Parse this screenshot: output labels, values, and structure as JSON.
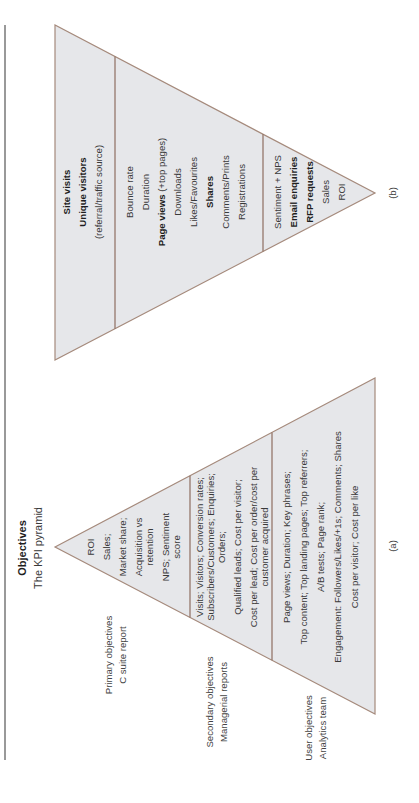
{
  "header": {
    "heading": "Objectives",
    "subheading": "The KPI pyramid"
  },
  "pyramid_a": {
    "caption": "(a)",
    "levels": [
      {
        "side_label": [
          "Primary objectives",
          "C suite report"
        ],
        "items": [
          "ROI",
          "Sales;",
          "Market share;",
          "Acquisition vs",
          "retention",
          "NPS; Sentiment",
          "score"
        ]
      },
      {
        "side_label": [
          "Secondary objectives",
          "Managerial reports"
        ],
        "items": [
          "Visits; Visitors; Conversion rates;",
          "Subscribers/Customers; Enquiries;",
          "Orders;",
          "Qualified leads; Cost per visitor;",
          "Cost per lead; Cost per order/cost per",
          "customer acquired"
        ]
      },
      {
        "side_label": [
          "User objectives",
          "Analytics team"
        ],
        "items": [
          "Page views; Duration; Key phrases;",
          "Top content; Top landing pages; Top referrers;",
          "A/B tests; Page rank;",
          "Engagement: Followers/Likes/+1s; Comments; Shares",
          "Cost per visitor; Cost per like"
        ]
      }
    ]
  },
  "pyramid_b": {
    "caption": "(b)",
    "levels": [
      {
        "items": [
          {
            "text": "Site visits",
            "bold": true
          },
          {
            "text": "Unique visitors",
            "bold": true
          },
          {
            "text": "(referral/traffic source)",
            "bold": false
          }
        ]
      },
      {
        "items": [
          {
            "text": "Bounce rate",
            "bold": false
          },
          {
            "text": "Duration",
            "bold": false
          },
          {
            "text": "Page views",
            "bold": true,
            "suffix": " (+top pages)"
          },
          {
            "text": "Downloads",
            "bold": false
          },
          {
            "text": "Likes/Favourites",
            "bold": false
          },
          {
            "text": "Shares",
            "bold": true
          },
          {
            "text": "Comments/Prints",
            "bold": false
          },
          {
            "text": "Registrations",
            "bold": false
          }
        ]
      },
      {
        "items": [
          {
            "text": "Sentiment + NPS",
            "bold": false
          },
          {
            "text": "Email enquiries",
            "bold": true
          },
          {
            "text": "RFP requests",
            "bold": true
          },
          {
            "text": "Sales",
            "bold": false
          },
          {
            "text": "ROI",
            "bold": false
          }
        ]
      }
    ]
  },
  "colors": {
    "fill": "#e6e7ea",
    "stroke": "#a58a7c",
    "text": "#3a3a3a"
  }
}
